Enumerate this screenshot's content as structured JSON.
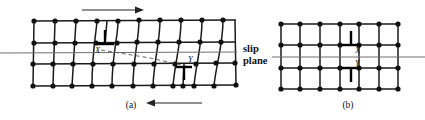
{
  "figure": {
    "panels": [
      {
        "id": "a",
        "label": "(a)",
        "caption_x": 131,
        "caption_y": 108
      },
      {
        "id": "b",
        "label": "(b)",
        "caption_x": 348,
        "caption_y": 108
      }
    ],
    "slip_plane_label": {
      "line1": "slip",
      "line2": "plane",
      "x": 243,
      "y": 52
    },
    "dislocations": [
      {
        "name": "X",
        "panel": "a",
        "type": "edge-positive",
        "symbol": "inverted-tee",
        "label_x": 95,
        "label_y": 48
      },
      {
        "name": "Y",
        "panel": "a",
        "type": "edge-negative",
        "symbol": "tee",
        "label_x": 188,
        "label_y": 62
      },
      {
        "name": "X",
        "panel": "b",
        "type": "edge-positive",
        "symbol": "inverted-tee",
        "label_x": 358,
        "label_y": 49
      },
      {
        "name": "Y",
        "panel": "b",
        "type": "edge-negative",
        "symbol": "tee",
        "label_x": 358,
        "label_y": 65
      }
    ],
    "arrows": [
      {
        "name": "top-shear-arrow",
        "direction": "right",
        "x1": 82,
        "y1": 10,
        "x2": 143,
        "y2": 10
      },
      {
        "name": "bottom-shear-arrow",
        "direction": "left",
        "x1": 202,
        "y1": 103,
        "x2": 146,
        "y2": 103
      }
    ],
    "slip_plane_line_a": {
      "x1": 0,
      "y1": 53,
      "x2": 237,
      "y2": 52
    },
    "slip_plane_line_b": {
      "x1": 281,
      "y1": 57,
      "x2": 425,
      "y2": 57
    },
    "colors": {
      "atom": "#111111",
      "lattice": "#1a1a1a",
      "slip_plane": "#6f6f6f",
      "dashed_glide_path": "#555555",
      "background": "#ffffff"
    },
    "lattice_a": {
      "rows": 5,
      "columns_top": 11,
      "columns_bottom": 12,
      "note": "distorted lattice with extra half-plane at X and at Y"
    },
    "lattice_b": {
      "rows": 5,
      "columns": 8,
      "note": "regular undistorted lattice after annihilation"
    }
  }
}
